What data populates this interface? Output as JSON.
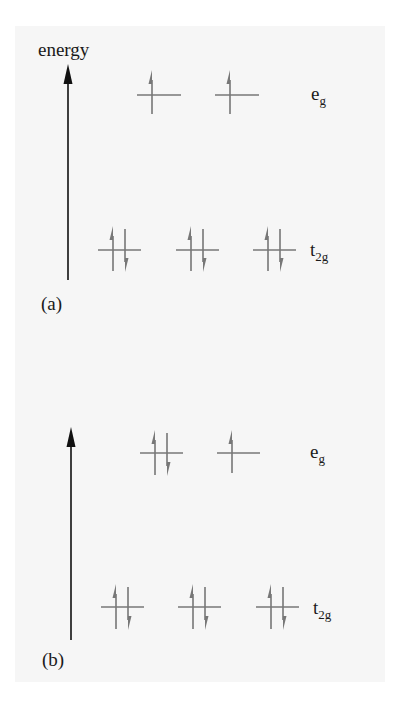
{
  "figure": {
    "axis_label": "energy",
    "panels": [
      {
        "id": "a",
        "caption": "(a)",
        "levels": [
          {
            "name": "e",
            "sub": "g",
            "orbitals": [
              {
                "electrons": 1
              },
              {
                "electrons": 1
              }
            ]
          },
          {
            "name": "t",
            "sub": "2g",
            "orbitals": [
              {
                "electrons": 2
              },
              {
                "electrons": 2
              },
              {
                "electrons": 2
              }
            ]
          }
        ]
      },
      {
        "id": "b",
        "caption": "(b)",
        "levels": [
          {
            "name": "e",
            "sub": "g",
            "orbitals": [
              {
                "electrons": 2
              },
              {
                "electrons": 1
              }
            ]
          },
          {
            "name": "t",
            "sub": "2g",
            "orbitals": [
              {
                "electrons": 2
              },
              {
                "electrons": 2
              },
              {
                "electrons": 2
              }
            ]
          }
        ]
      }
    ],
    "colors": {
      "axis": "#111111",
      "orbital": "#777777",
      "text": "#1a1a1a",
      "panel_bg": "#f6f6f6"
    }
  }
}
